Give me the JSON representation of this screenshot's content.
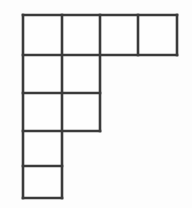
{
  "figure": {
    "name": "polyomino-grid-figure",
    "kind": "decomino-staircase",
    "cell_count": 10,
    "row_count": 5,
    "column_count": 4,
    "colors": {
      "background": "#fdfdfd",
      "cell_fill": "#fefefe",
      "line": "#3b3b3b"
    },
    "line_width": 2.6,
    "geometry": {
      "column_x": [
        23,
        62,
        100,
        138,
        177
      ],
      "row_y": [
        15,
        55,
        93,
        131,
        166,
        198
      ]
    },
    "rows": [
      {
        "index": 1,
        "cells_in_row": 4,
        "columns": [
          1,
          2,
          3,
          4
        ],
        "y_top": 15,
        "y_bottom": 55
      },
      {
        "index": 2,
        "cells_in_row": 2,
        "columns": [
          1,
          2
        ],
        "y_top": 55,
        "y_bottom": 93
      },
      {
        "index": 3,
        "cells_in_row": 2,
        "columns": [
          1,
          2
        ],
        "y_top": 93,
        "y_bottom": 131
      },
      {
        "index": 4,
        "cells_in_row": 1,
        "columns": [
          1
        ],
        "y_top": 131,
        "y_bottom": 166
      },
      {
        "index": 5,
        "cells_in_row": 1,
        "columns": [
          1
        ],
        "y_top": 166,
        "y_bottom": 198
      }
    ],
    "cells": [
      {
        "id": "r1c1",
        "row": 1,
        "col": 1,
        "x": 23,
        "y": 15,
        "w": 39,
        "h": 40
      },
      {
        "id": "r1c2",
        "row": 1,
        "col": 2,
        "x": 62,
        "y": 15,
        "w": 38,
        "h": 40
      },
      {
        "id": "r1c3",
        "row": 1,
        "col": 3,
        "x": 100,
        "y": 15,
        "w": 38,
        "h": 40
      },
      {
        "id": "r1c4",
        "row": 1,
        "col": 4,
        "x": 138,
        "y": 15,
        "w": 39,
        "h": 40
      },
      {
        "id": "r2c1",
        "row": 2,
        "col": 1,
        "x": 23,
        "y": 55,
        "w": 39,
        "h": 38
      },
      {
        "id": "r2c2",
        "row": 2,
        "col": 2,
        "x": 62,
        "y": 55,
        "w": 38,
        "h": 38
      },
      {
        "id": "r3c1",
        "row": 3,
        "col": 1,
        "x": 23,
        "y": 93,
        "w": 39,
        "h": 38
      },
      {
        "id": "r3c2",
        "row": 3,
        "col": 2,
        "x": 62,
        "y": 93,
        "w": 38,
        "h": 38
      },
      {
        "id": "r4c1",
        "row": 4,
        "col": 1,
        "x": 23,
        "y": 131,
        "w": 39,
        "h": 35
      },
      {
        "id": "r5c1",
        "row": 5,
        "col": 1,
        "x": 23,
        "y": 166,
        "w": 39,
        "h": 32
      }
    ],
    "edges": [
      {
        "id": "top-row1",
        "x1": 23,
        "y1": 15,
        "x2": 177,
        "y2": 15
      },
      {
        "id": "divider-row1-row2",
        "x1": 23,
        "y1": 55,
        "x2": 177,
        "y2": 55
      },
      {
        "id": "divider-row2-row3",
        "x1": 23,
        "y1": 93,
        "x2": 100,
        "y2": 93
      },
      {
        "id": "divider-row3-row4",
        "x1": 23,
        "y1": 131,
        "x2": 100,
        "y2": 131
      },
      {
        "id": "divider-row4-row5",
        "x1": 23,
        "y1": 166,
        "x2": 62,
        "y2": 166
      },
      {
        "id": "bottom-row5",
        "x1": 23,
        "y1": 198,
        "x2": 62,
        "y2": 198
      },
      {
        "id": "left-edge",
        "x1": 23,
        "y1": 15,
        "x2": 23,
        "y2": 198
      },
      {
        "id": "divider-col1-col2",
        "x1": 62,
        "y1": 15,
        "x2": 62,
        "y2": 198
      },
      {
        "id": "divider-col2-col3",
        "x1": 100,
        "y1": 15,
        "x2": 100,
        "y2": 131
      },
      {
        "id": "divider-col3-col4",
        "x1": 138,
        "y1": 15,
        "x2": 138,
        "y2": 55
      },
      {
        "id": "right-edge-row1",
        "x1": 177,
        "y1": 15,
        "x2": 177,
        "y2": 55
      }
    ]
  }
}
